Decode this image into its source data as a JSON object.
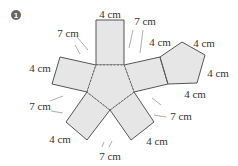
{
  "problem": {
    "number": "1",
    "description": "Net of a pentagonal prism"
  },
  "labels": {
    "top_width": "4 cm",
    "top_left_7": "7 cm",
    "top_right_7": "7 cm",
    "upper_right_4": "4 cm",
    "left_4": "4 cm",
    "pentagon_top_4": "4 cm",
    "pentagon_right_4": "4 cm",
    "right_rect_4": "4 cm",
    "left_lower_7": "7 cm",
    "right_lower_7": "7 cm",
    "bottom_left_4": "4 cm",
    "bottom_right_4": "4 cm",
    "bottom_7": "7 cm"
  },
  "colors": {
    "face_fill": "#e6e6e6",
    "edge": "#555555"
  }
}
